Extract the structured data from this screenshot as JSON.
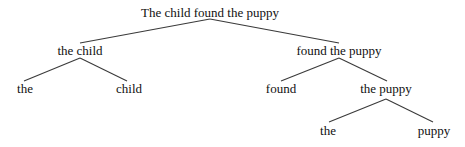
{
  "diagram": {
    "type": "constituency-tree",
    "colors": {
      "text": "#111111",
      "edge": "#3a3a3a",
      "background": "#ffffff"
    },
    "nodes": {
      "root": {
        "label": "The child found the puppy",
        "x": 210,
        "y": 6
      },
      "np_subject": {
        "label": "the child",
        "x": 80,
        "y": 44
      },
      "vp": {
        "label": "found the puppy",
        "x": 339,
        "y": 44
      },
      "det_subject": {
        "label": "the",
        "x": 25,
        "y": 82
      },
      "n_subject": {
        "label": "child",
        "x": 129,
        "y": 82
      },
      "verb": {
        "label": "found",
        "x": 281,
        "y": 82
      },
      "np_object": {
        "label": "the puppy",
        "x": 386,
        "y": 82
      },
      "det_object": {
        "label": "the",
        "x": 328,
        "y": 124
      },
      "n_object": {
        "label": "puppy",
        "x": 434,
        "y": 124
      }
    },
    "edges": [
      {
        "from": "root",
        "to": "np_subject",
        "x1": 210,
        "y1": 19,
        "x2": 80,
        "y2": 43
      },
      {
        "from": "root",
        "to": "vp",
        "x1": 210,
        "y1": 19,
        "x2": 339,
        "y2": 43
      },
      {
        "from": "np_subject",
        "to": "det_subject",
        "x1": 80,
        "y1": 58,
        "x2": 24,
        "y2": 81
      },
      {
        "from": "np_subject",
        "to": "n_subject",
        "x1": 80,
        "y1": 58,
        "x2": 127,
        "y2": 81
      },
      {
        "from": "vp",
        "to": "verb",
        "x1": 339,
        "y1": 58,
        "x2": 281,
        "y2": 81
      },
      {
        "from": "vp",
        "to": "np_object",
        "x1": 339,
        "y1": 58,
        "x2": 387,
        "y2": 81
      },
      {
        "from": "np_object",
        "to": "det_object",
        "x1": 386,
        "y1": 99,
        "x2": 329,
        "y2": 122
      },
      {
        "from": "np_object",
        "to": "n_object",
        "x1": 386,
        "y1": 99,
        "x2": 433,
        "y2": 122
      }
    ]
  }
}
